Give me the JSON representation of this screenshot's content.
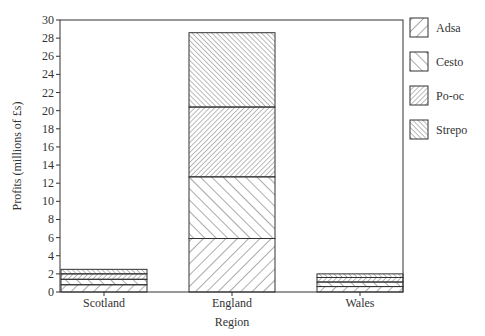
{
  "chart_data": {
    "type": "bar",
    "stacked": true,
    "title": "",
    "xlabel": "Region",
    "ylabel": "Profits (millions of £s)",
    "categories": [
      "Scotland",
      "England",
      "Wales"
    ],
    "series": [
      {
        "name": "Adsa",
        "pattern": "diag-up-wide",
        "values": [
          0.8,
          5.9,
          0.6
        ]
      },
      {
        "name": "Cesto",
        "pattern": "diag-down-wide",
        "values": [
          0.6,
          6.8,
          0.5
        ]
      },
      {
        "name": "Po-oc",
        "pattern": "diag-up-dense",
        "values": [
          0.6,
          7.7,
          0.5
        ]
      },
      {
        "name": "Strepo",
        "pattern": "diag-down-dense",
        "values": [
          0.5,
          8.2,
          0.4
        ]
      }
    ],
    "ylim": [
      0,
      30
    ],
    "yticks": [
      0,
      2,
      4,
      6,
      8,
      10,
      12,
      14,
      16,
      18,
      20,
      22,
      24,
      26,
      28,
      30
    ],
    "grid": false,
    "legend_position": "right",
    "colors": {
      "line": "#333333",
      "background": "#ffffff"
    }
  }
}
